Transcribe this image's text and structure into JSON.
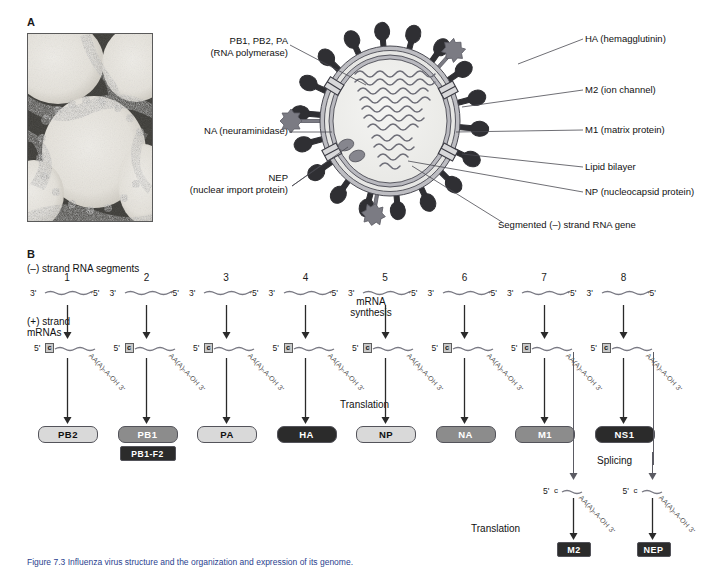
{
  "figure": {
    "panelA_letter": "A",
    "panelB_letter": "B",
    "caption": "Figure 7.3    Influenza virus structure and the organization and expression of its genome."
  },
  "panelA": {
    "micrograph_alt": "electron-micrograph-of-influenza-virions",
    "labels_left": [
      {
        "id": "polymerase",
        "line1": "PB1, PB2, PA",
        "line2": "(RNA polymerase)"
      },
      {
        "id": "na",
        "line1": "NA (neuraminidase)",
        "line2": ""
      },
      {
        "id": "nep",
        "line1": "NEP",
        "line2": "(nuclear import protein)"
      }
    ],
    "labels_right": [
      {
        "id": "ha",
        "text": "HA (hemagglutinin)"
      },
      {
        "id": "m2",
        "text": "M2 (ion channel)"
      },
      {
        "id": "m1",
        "text": "M1 (matrix protein)"
      },
      {
        "id": "lipid",
        "text": "Lipid bilayer"
      },
      {
        "id": "np",
        "text": "NP (nucleocapsid protein)"
      },
      {
        "id": "rna",
        "text": "Segmented (–) strand RNA gene"
      }
    ]
  },
  "panelB": {
    "minus_strand_label": "(–) strand RNA segments",
    "plus_strand_label_line1": "(+) strand",
    "plus_strand_label_line2": "mRNAs",
    "mrna_synthesis_line1": "mRNA",
    "mrna_synthesis_line2": "synthesis",
    "translation_label": "Translation",
    "splicing_label": "Splicing",
    "translation_label2": "Translation",
    "five_prime": "5'",
    "three_prime": "3'",
    "cap_letter": "c",
    "polya_tail": "AA(A)ₙA-OH 3'",
    "segments": [
      {
        "number": "1",
        "protein": "PB2",
        "shade": "light",
        "second_protein": null
      },
      {
        "number": "2",
        "protein": "PB1",
        "shade": "mid",
        "second_protein": "PB1-F2"
      },
      {
        "number": "3",
        "protein": "PA",
        "shade": "light",
        "second_protein": null
      },
      {
        "number": "4",
        "protein": "HA",
        "shade": "dark",
        "second_protein": null
      },
      {
        "number": "5",
        "protein": "NP",
        "shade": "light",
        "second_protein": null
      },
      {
        "number": "6",
        "protein": "NA",
        "shade": "mid",
        "second_protein": null
      },
      {
        "number": "7",
        "protein": "M1",
        "shade": "mid",
        "second_protein": null
      },
      {
        "number": "8",
        "protein": "NS1",
        "shade": "dark",
        "second_protein": null
      }
    ],
    "spliced": [
      {
        "from_segment": "7",
        "protein": "M2"
      },
      {
        "from_segment": "8",
        "protein": "NEP"
      }
    ]
  },
  "colors": {
    "light_box": "#d9d9d9",
    "mid_box": "#8c8c8c",
    "dark_box": "#2b2b2b",
    "light_text": "#111111",
    "dark_text": "#ffffff",
    "line": "#4a4a52",
    "caption": "#2a3f8f"
  }
}
